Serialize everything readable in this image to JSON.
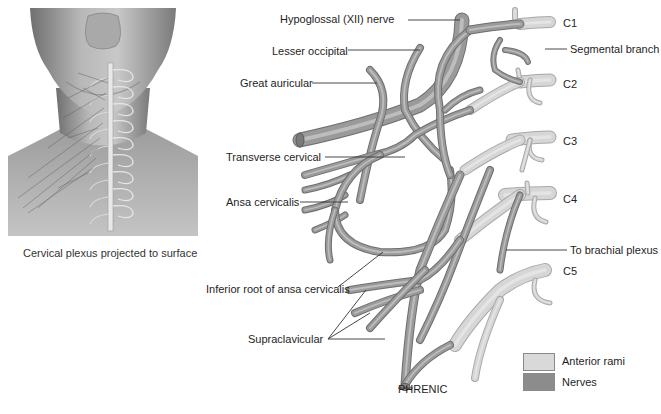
{
  "figure": {
    "left_panel": {
      "caption": "Cervical plexus projected to surface"
    },
    "labels": {
      "hypoglossal": "Hypoglossal (XII) nerve",
      "lesser_occipital": "Lesser occipital",
      "great_auricular": "Great auricular",
      "transverse_cervical": "Transverse cervical",
      "ansa_cervicalis": "Ansa cervicalis",
      "inferior_root": "Inferior root of ansa cervicalis",
      "supraclavicular": "Supraclavicular",
      "phrenic": "PHRENIC",
      "segmental_branch": "Segmental branch",
      "to_brachial_plexus": "To brachial plexus",
      "c1": "C1",
      "c2": "C2",
      "c3": "C3",
      "c4": "C4",
      "c5": "C5"
    },
    "legend": {
      "items": [
        {
          "label": "Anterior rami",
          "color": "#d9d9d9"
        },
        {
          "label": "Nerves",
          "color": "#8c8c8c"
        }
      ]
    },
    "colors": {
      "nerve": "#9a9a9a",
      "nerve_edge": "#6e6e6e",
      "ramus": "#d6d6d6",
      "ramus_edge": "#a8a8a8",
      "leader": "#333333",
      "skin_dark": "#7a7a7a",
      "skin_light": "#d0d0d0"
    }
  }
}
